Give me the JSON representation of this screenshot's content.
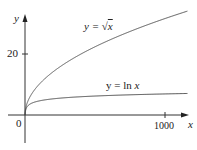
{
  "chart_data": {
    "type": "line",
    "title": "",
    "xlabel": "x",
    "ylabel": "y",
    "xlim": [
      0,
      1160
    ],
    "ylim": [
      -9,
      33
    ],
    "x_ticks": [
      {
        "value": 1000,
        "label": "1000"
      }
    ],
    "y_ticks": [
      {
        "value": 20,
        "label": "20"
      }
    ],
    "origin_label": "0",
    "grid": false,
    "legend": null,
    "series": [
      {
        "name": "y = √x",
        "function": "sqrt(x)",
        "x": [
          0,
          10,
          50,
          100,
          200,
          400,
          600,
          800,
          1000,
          1160
        ],
        "values": [
          0,
          3.16,
          7.07,
          10,
          14.14,
          20,
          24.49,
          28.28,
          31.62,
          34.06
        ]
      },
      {
        "name": "y = ln x",
        "function": "ln(x)",
        "x": [
          1,
          10,
          50,
          100,
          200,
          400,
          600,
          800,
          1000,
          1160
        ],
        "values": [
          0,
          2.3,
          3.91,
          4.61,
          5.3,
          5.99,
          6.4,
          6.68,
          6.91,
          7.06
        ]
      }
    ],
    "annotations": [
      {
        "text": "y = √x",
        "near_series": "y = √x"
      },
      {
        "text": "y = ln x",
        "near_series": "y = ln x"
      }
    ]
  },
  "labels": {
    "y_axis": "y",
    "x_axis": "x",
    "origin": "0",
    "y_tick_20": "20",
    "x_tick_1000": "1000",
    "sqrt_label_prefix": "y = ",
    "sqrt_label_var": "x",
    "ln_label_prefix": "y = ln ",
    "ln_label_var": "x"
  }
}
